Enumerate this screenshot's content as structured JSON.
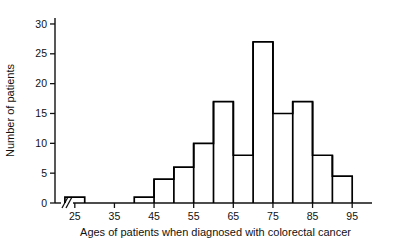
{
  "chart_data": {
    "type": "bar",
    "title": "",
    "subtitle": "",
    "xlabel": "Ages of patients when diagnosed with colorectal cancer",
    "ylabel": "Number of patients",
    "bin_width": 5,
    "bin_edges": [
      22.5,
      27.5,
      40,
      45,
      50,
      55,
      60,
      65,
      70,
      75,
      80,
      85,
      90,
      95
    ],
    "categories": [
      "22.5-27.5",
      "40-45",
      "45-50",
      "50-55",
      "55-60",
      "60-65",
      "65-70",
      "70-75",
      "75-80",
      "80-85",
      "85-90",
      "90-95"
    ],
    "values": [
      1,
      1,
      4,
      6,
      10,
      17,
      8,
      27,
      15,
      17,
      8,
      4.5
    ],
    "bars": [
      {
        "start": 22.5,
        "end": 27.5,
        "value": 1
      },
      {
        "start": 40,
        "end": 45,
        "value": 1
      },
      {
        "start": 45,
        "end": 50,
        "value": 4
      },
      {
        "start": 50,
        "end": 55,
        "value": 6
      },
      {
        "start": 55,
        "end": 60,
        "value": 10
      },
      {
        "start": 60,
        "end": 65,
        "value": 17
      },
      {
        "start": 65,
        "end": 70,
        "value": 8
      },
      {
        "start": 70,
        "end": 75,
        "value": 27
      },
      {
        "start": 75,
        "end": 80,
        "value": 15
      },
      {
        "start": 80,
        "end": 85,
        "value": 17
      },
      {
        "start": 85,
        "end": 90,
        "value": 8
      },
      {
        "start": 90,
        "end": 95,
        "value": 4.5
      }
    ],
    "xlim": [
      20,
      100
    ],
    "ylim": [
      0,
      31
    ],
    "x_ticks": [
      25,
      35,
      45,
      55,
      65,
      75,
      85,
      95
    ],
    "x_tick_labels": [
      "25",
      "35",
      "45",
      "55",
      "65",
      "75",
      "85",
      "95"
    ],
    "y_ticks": [
      0,
      5,
      10,
      15,
      20,
      25,
      30
    ],
    "y_tick_labels": [
      "0",
      "5",
      "10",
      "15",
      "20",
      "25",
      "30"
    ],
    "grid": false,
    "legend": null,
    "axis_break": {
      "axis": "x",
      "present": true,
      "symbol": "double-slash"
    },
    "colors": {
      "bar_stroke": "#000000",
      "bar_fill": "#ffffff",
      "axis": "#111111",
      "text": "#111111",
      "background": "#ffffff"
    }
  }
}
